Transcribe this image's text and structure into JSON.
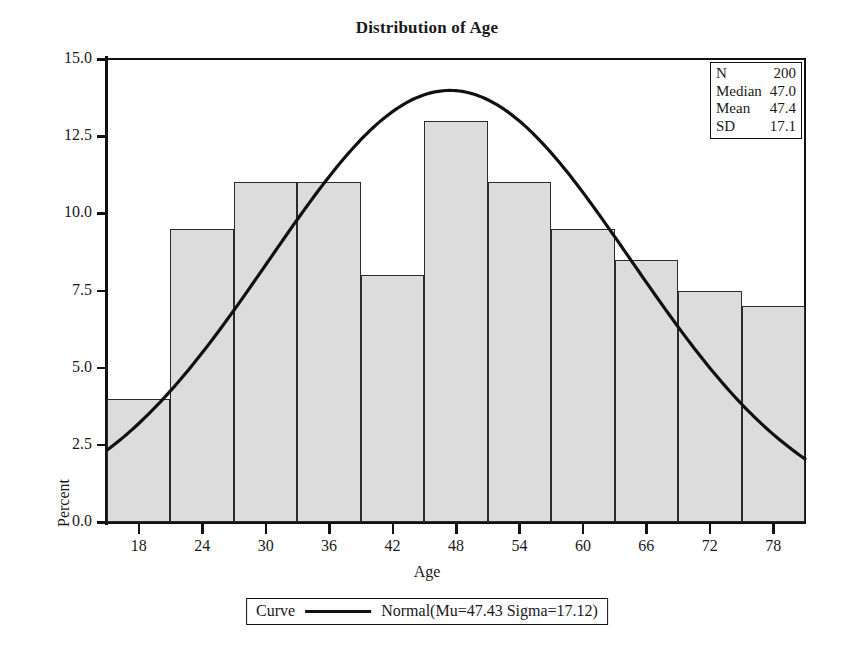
{
  "chart_data": {
    "type": "bar",
    "title": "Distribution of Age",
    "xlabel": "Age",
    "ylabel": "Percent",
    "grid": false,
    "xlim": [
      15,
      81
    ],
    "ylim": [
      0.0,
      15.0
    ],
    "bin_width": 6,
    "categories": [
      "18",
      "24",
      "30",
      "36",
      "42",
      "48",
      "54",
      "60",
      "66",
      "72",
      "78"
    ],
    "bin_centers": [
      18,
      24,
      30,
      36,
      42,
      48,
      54,
      60,
      66,
      72,
      78
    ],
    "bin_edges": [
      15,
      21,
      27,
      33,
      39,
      45,
      51,
      57,
      63,
      69,
      75,
      81
    ],
    "values": [
      4.0,
      9.5,
      11.0,
      11.0,
      8.0,
      13.0,
      11.0,
      9.5,
      8.5,
      7.5,
      7.0
    ],
    "x_ticks": [
      "18",
      "24",
      "30",
      "36",
      "42",
      "48",
      "54",
      "60",
      "66",
      "72",
      "78"
    ],
    "y_ticks": [
      "0.0",
      "2.5",
      "5.0",
      "7.5",
      "10.0",
      "12.5",
      "15.0"
    ],
    "y_tick_values": [
      0.0,
      2.5,
      5.0,
      7.5,
      10.0,
      12.5,
      15.0
    ],
    "bar_fill_color": "#dcdcdc",
    "bar_edge_color": "#2b2b2b",
    "curve_color": "#111111",
    "series": [
      {
        "name": "Normal(Mu=47.43 Sigma=17.12)",
        "type": "line",
        "mu": 47.43,
        "sigma": 17.12,
        "peak_percent": 14.0,
        "scale_note": "normal density scaled to percent with 6-unit bins"
      }
    ]
  },
  "title": "Distribution of Age",
  "axes": {
    "y_title": "Percent",
    "x_title": "Age"
  },
  "stats_box": {
    "rows": [
      {
        "key": "N",
        "value": "200"
      },
      {
        "key": "Median",
        "value": "47.0"
      },
      {
        "key": "Mean",
        "value": "47.4"
      },
      {
        "key": "SD",
        "value": "17.1"
      }
    ]
  },
  "legend": {
    "key_label": "Curve",
    "series_label": "Normal(Mu=47.43 Sigma=17.12)"
  }
}
